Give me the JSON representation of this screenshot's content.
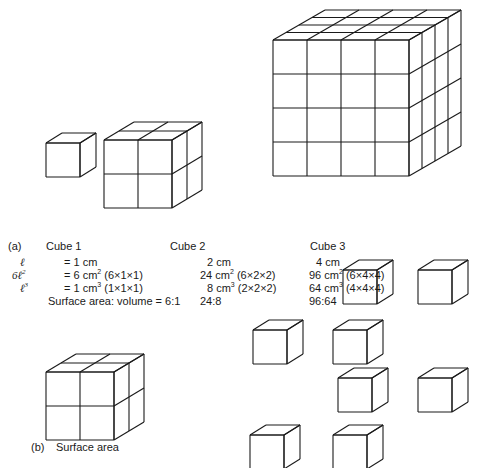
{
  "figure_a": {
    "part_label": "(a)",
    "cubes": [
      {
        "name": "Cube 1",
        "side": "1 cm",
        "divisions": 1
      },
      {
        "name": "Cube 2",
        "side": "2 cm",
        "divisions": 2
      },
      {
        "name": "Cube 3",
        "side": "4 cm",
        "divisions": 4
      }
    ],
    "table": {
      "row_symbols": [
        "ℓ",
        "6ℓ",
        "ℓ"
      ],
      "row_symbol_sup": [
        "",
        "2",
        "3"
      ],
      "side_row": [
        "= 1 cm",
        "2 cm",
        "4 cm"
      ],
      "area_row": [
        {
          "value": "= 6 cm",
          "sup": "2",
          "calc": "(6×1×1)"
        },
        {
          "value": "24 cm",
          "sup": "2",
          "calc": "(6×2×2)"
        },
        {
          "value": "96 cm",
          "sup": "2",
          "calc": "(6×4×4)"
        }
      ],
      "volume_row": [
        {
          "value": "= 1 cm",
          "sup": "3",
          "calc": "(1×1×1)"
        },
        {
          "value": "8 cm",
          "sup": "3",
          "calc": "(2×2×2)"
        },
        {
          "value": "64 cm",
          "sup": "3",
          "calc": "(4×4×4)"
        }
      ],
      "ratio_label": "Surface area: volume = 6:1",
      "ratio_values": [
        "24:8",
        "96:64"
      ]
    }
  },
  "figure_b": {
    "part_label": "(b)",
    "caption": "Surface area",
    "scattered_cube_count": 8
  },
  "colors": {
    "line": "#1a1a1a",
    "background": "#ffffff"
  }
}
